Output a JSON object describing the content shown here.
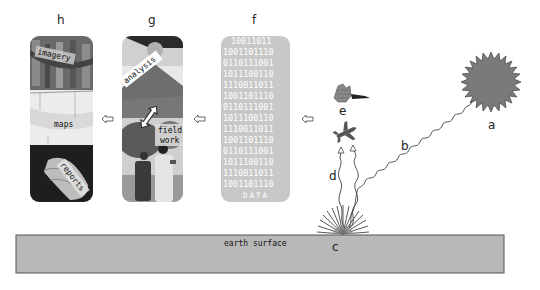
{
  "labels": {
    "a": "a",
    "b": "b",
    "c": "c",
    "d": "d",
    "e": "e",
    "f": "f",
    "g": "g",
    "h": "h"
  },
  "earth": {
    "label": "earth surface",
    "fill": "#b8b8b8"
  },
  "data_panel": {
    "title": "DATA",
    "fill": "#c8c8c8",
    "rows": [
      "10011011",
      "1001101110",
      "0110111001",
      "1011100110",
      "1110011011",
      "1001101110",
      "0110111001",
      "1011100110",
      "1110011011",
      "1001101110",
      "0110111001",
      "1011100110",
      "1110011011",
      "1001101110"
    ]
  },
  "analysis_panel": {
    "top_tag": "analysis",
    "bottom_tag": "field\nwork",
    "bottom_tag_line1": "field",
    "bottom_tag_line2": "work"
  },
  "products_panel": {
    "tag_imagery": "imagery",
    "tag_maps": "maps",
    "tag_reports": "reports"
  },
  "sun": {
    "fill": "#7a7a7a"
  }
}
